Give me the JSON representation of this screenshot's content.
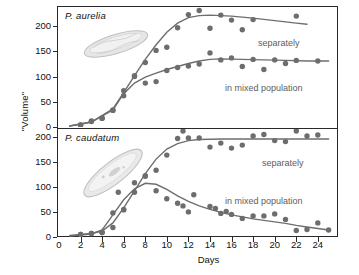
{
  "figure": {
    "ylabel": "\"Volume\"",
    "xlabel": "Days"
  },
  "panels": [
    {
      "id": "top",
      "species": "P. aurelia",
      "organism_icon": "paramecium-aurelia-illustration",
      "annotations": [
        {
          "name": "separately",
          "text": "separately",
          "x": 258,
          "y": 38
        },
        {
          "name": "mixed",
          "text": "in mixed population",
          "x": 225,
          "y": 83
        }
      ]
    },
    {
      "id": "bottom",
      "species": "P. caudatum",
      "organism_icon": "paramecium-caudatum-illustration",
      "annotations": [
        {
          "name": "separately",
          "text": "separately",
          "x": 262,
          "y": 158
        },
        {
          "name": "mixed",
          "text": "in mixed population",
          "x": 225,
          "y": 196
        }
      ]
    }
  ],
  "axes": {
    "y_ticks_top": [
      0,
      50,
      100,
      150,
      200
    ],
    "y_ticks_bottom": [
      0,
      50,
      100,
      150,
      200
    ],
    "x_ticks": [
      0,
      2,
      4,
      6,
      8,
      10,
      12,
      14,
      16,
      18,
      20,
      22,
      24
    ]
  },
  "colors": {
    "frame": "#2a2a2a",
    "curve": "#6e6e6e",
    "point": "#6d6d6d",
    "annotation": "#5d5d5d",
    "text": "#111111"
  },
  "chart_data": {
    "type": "scatter",
    "title": "",
    "xlabel": "Days",
    "ylabel": "\"Volume\"",
    "xlim": [
      0,
      25.5
    ],
    "grid": false,
    "legend": "inline-annotations",
    "subplots": [
      {
        "name": "P. aurelia",
        "ylim": [
          0,
          240
        ],
        "yticks": [
          0,
          50,
          100,
          150,
          200
        ],
        "series": [
          {
            "name": "separately",
            "points": [
              [
                2,
                4
              ],
              [
                3,
                12
              ],
              [
                4,
                18
              ],
              [
                5,
                34
              ],
              [
                6,
                72
              ],
              [
                7,
                100
              ],
              [
                8,
                128
              ],
              [
                9,
                152
              ],
              [
                10,
                158
              ],
              [
                11,
                197
              ],
              [
                12,
                223
              ],
              [
                13,
                231
              ],
              [
                14,
                196
              ],
              [
                15,
                222
              ],
              [
                16,
                212
              ],
              [
                17,
                193
              ],
              [
                18,
                213
              ],
              [
                22,
                220
              ]
            ],
            "fit_curve": [
              [
                1,
                2
              ],
              [
                3,
                10
              ],
              [
                5,
                36
              ],
              [
                6,
                68
              ],
              [
                7,
                102
              ],
              [
                8,
                134
              ],
              [
                9,
                163
              ],
              [
                10,
                188
              ],
              [
                11,
                206
              ],
              [
                12,
                217
              ],
              [
                13,
                221
              ],
              [
                14,
                222
              ],
              [
                16,
                220
              ],
              [
                18,
                216
              ],
              [
                20,
                211
              ],
              [
                22,
                206
              ],
              [
                23,
                204
              ]
            ]
          },
          {
            "name": "in mixed population",
            "points": [
              [
                2,
                4
              ],
              [
                3,
                11
              ],
              [
                4,
                17
              ],
              [
                5,
                33
              ],
              [
                6,
                62
              ],
              [
                7,
                102
              ],
              [
                8,
                87
              ],
              [
                9,
                90
              ],
              [
                10,
                112
              ],
              [
                11,
                118
              ],
              [
                12,
                121
              ],
              [
                13,
                125
              ],
              [
                14,
                147
              ],
              [
                15,
                133
              ],
              [
                16,
                137
              ],
              [
                17,
                120
              ],
              [
                18,
                134
              ],
              [
                19,
                114
              ],
              [
                20,
                133
              ],
              [
                21,
                126
              ],
              [
                22,
                132
              ],
              [
                24,
                131
              ]
            ],
            "fit_curve": [
              [
                1,
                2
              ],
              [
                3,
                10
              ],
              [
                5,
                34
              ],
              [
                6,
                66
              ],
              [
                7,
                87
              ],
              [
                8,
                99
              ],
              [
                9,
                107
              ],
              [
                10,
                114
              ],
              [
                11,
                120
              ],
              [
                12,
                126
              ],
              [
                13,
                131
              ],
              [
                14,
                134
              ],
              [
                15,
                135
              ],
              [
                17,
                134
              ],
              [
                19,
                133
              ],
              [
                21,
                132
              ],
              [
                23,
                131
              ],
              [
                25,
                131
              ]
            ]
          }
        ]
      },
      {
        "name": "P. caudatum",
        "ylim": [
          0,
          215
        ],
        "yticks": [
          0,
          50,
          100,
          150,
          200
        ],
        "series": [
          {
            "name": "separately",
            "points": [
              [
                2,
                5
              ],
              [
                3,
                7
              ],
              [
                4,
                9
              ],
              [
                5,
                19
              ],
              [
                6,
                55
              ],
              [
                7,
                89
              ],
              [
                8,
                122
              ],
              [
                9,
                133
              ],
              [
                10,
                163
              ],
              [
                11,
                196
              ],
              [
                11.5,
                211
              ],
              [
                12,
                197
              ],
              [
                13,
                197
              ],
              [
                14,
                179
              ],
              [
                15,
                187
              ],
              [
                16,
                177
              ],
              [
                17,
                183
              ],
              [
                18,
                201
              ],
              [
                19,
                204
              ],
              [
                20,
                192
              ],
              [
                21,
                190
              ],
              [
                22,
                211
              ],
              [
                23,
                201
              ],
              [
                24,
                203
              ]
            ],
            "fit_curve": [
              [
                1,
                3
              ],
              [
                3,
                7
              ],
              [
                4,
                12
              ],
              [
                5,
                28
              ],
              [
                6,
                58
              ],
              [
                7,
                92
              ],
              [
                8,
                126
              ],
              [
                9,
                155
              ],
              [
                10,
                175
              ],
              [
                11,
                186
              ],
              [
                12,
                192
              ],
              [
                13,
                194
              ],
              [
                15,
                195
              ],
              [
                18,
                195
              ],
              [
                21,
                195
              ],
              [
                24,
                195
              ],
              [
                25,
                195
              ]
            ]
          },
          {
            "name": "in mixed population",
            "points": [
              [
                2,
                5
              ],
              [
                3,
                7
              ],
              [
                4,
                9
              ],
              [
                5,
                48
              ],
              [
                5.5,
                89
              ],
              [
                6,
                54
              ],
              [
                7,
                108
              ],
              [
                8,
                121
              ],
              [
                9,
                92
              ],
              [
                10,
                76
              ],
              [
                11,
                67
              ],
              [
                11.5,
                62
              ],
              [
                12,
                50
              ],
              [
                12.5,
                84
              ],
              [
                14,
                61
              ],
              [
                14.5,
                57
              ],
              [
                15,
                47
              ],
              [
                15.5,
                51
              ],
              [
                16,
                45
              ],
              [
                17,
                37
              ],
              [
                18,
                42
              ],
              [
                19,
                42
              ],
              [
                20,
                46
              ],
              [
                21,
                35
              ],
              [
                22,
                13
              ],
              [
                23,
                15
              ],
              [
                24,
                28
              ],
              [
                25,
                14
              ]
            ],
            "fit_curve": [
              [
                1,
                2
              ],
              [
                3,
                6
              ],
              [
                4,
                14
              ],
              [
                5,
                44
              ],
              [
                6,
                74
              ],
              [
                7,
                96
              ],
              [
                8,
                107
              ],
              [
                9,
                105
              ],
              [
                10,
                95
              ],
              [
                11,
                82
              ],
              [
                12,
                71
              ],
              [
                13,
                62
              ],
              [
                14,
                55
              ],
              [
                15,
                49
              ],
              [
                16,
                44
              ],
              [
                17,
                40
              ],
              [
                18,
                36
              ],
              [
                19,
                33
              ],
              [
                20,
                30
              ],
              [
                21,
                27
              ],
              [
                22,
                23
              ],
              [
                23,
                20
              ],
              [
                24,
                17
              ],
              [
                25,
                14
              ]
            ]
          }
        ]
      }
    ]
  }
}
